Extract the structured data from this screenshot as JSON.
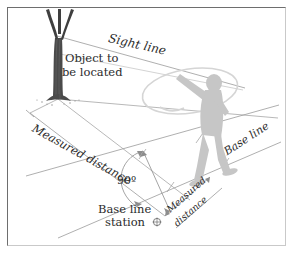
{
  "figure": {
    "background": "#ffffff",
    "frame_color": "#6e6e6e",
    "ink_color": "#2b2b2b",
    "line_color": "#8d8d8d",
    "figure_fill": "#c9c9c9",
    "tree_color": "#3a3a3a"
  },
  "labels": {
    "sight_line": "Sight line",
    "object_line1": "Object to",
    "object_line2": "be located",
    "measured_distance_left": "Measured distance",
    "angle": "90º",
    "base_line_station_line1": "Base line",
    "base_line_station_line2": "station",
    "measured_distance_right_line1": "Measured",
    "measured_distance_right_line2": "distance",
    "base_line": "Base line"
  },
  "icons": {
    "station_marker": "station-marker-icon",
    "tree": "tree-icon",
    "surveyor": "surveyor-figure-icon",
    "tape_loop": "measuring-tape-loop-icon"
  },
  "geometry": {
    "angle_value": 90,
    "angle_unit": "degrees",
    "sight_line_from": "tree",
    "sight_line_to": "surveyor-hand",
    "base_line_bearing": "lower-left to upper-right",
    "measured_distance_perpendicular": true
  }
}
